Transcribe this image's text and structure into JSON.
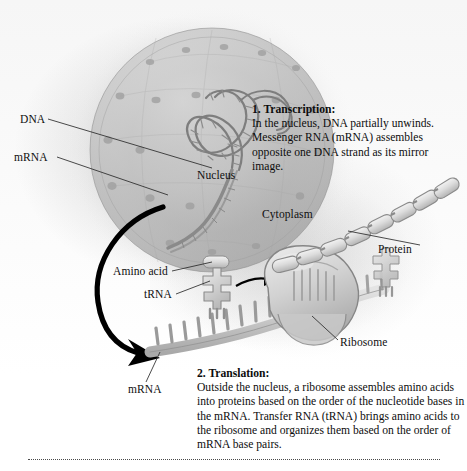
{
  "figure": {
    "background_color": "#ffffff",
    "ink_color": "#0f0f0f",
    "arrow_color": "#000000"
  },
  "labels": {
    "dna": "DNA",
    "mrna_nucleus": "mRNA",
    "nucleus": "Nucleus",
    "cytoplasm": "Cytoplasm",
    "protein": "Protein",
    "amino_acid": "Amino acid",
    "trna": "tRNA",
    "ribosome": "Ribosome",
    "mrna_cytoplasm": "mRNA"
  },
  "callouts": {
    "transcription": {
      "heading": "1. Transcription:",
      "body": "In the nucleus, DNA  partially unwinds. Messenger RNA (mRNA) assembles opposite one DNA strand as its mirror image."
    },
    "translation": {
      "heading": "2. Translation:",
      "body": "Outside the nucleus, a ribosome assembles amino acids into proteins based on the order of the nucleotide bases in the mRNA. Transfer RNA (tRNA) brings amino acids to the ribosome and organizes them based on the order of mRNA base pairs."
    }
  },
  "structures": {
    "nucleus_icon": "nucleus-sphere",
    "dna_icon": "dna-double-helix",
    "mrna_icon": "mrna-strand",
    "trna_icon": "trna-molecule",
    "ribosome_icon": "ribosome-shape",
    "protein_icon": "protein-bead-chain",
    "flow_arrow_icon": "curved-flow-arrow"
  }
}
